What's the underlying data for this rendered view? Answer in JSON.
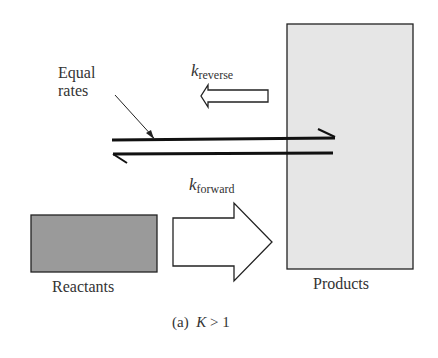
{
  "labels": {
    "equal_rates_line1": "Equal",
    "equal_rates_line2": "rates",
    "k_reverse_symbol": "k",
    "k_reverse_subscript": "reverse",
    "k_forward_symbol": "k",
    "k_forward_subscript": "forward",
    "reactants": "Reactants",
    "products": "Products",
    "caption_prefix": "(a)",
    "caption_var": "K",
    "caption_rel": "> 1"
  },
  "colors": {
    "reactants_fill": "#9a9a9a",
    "products_fill": "#e6e6e6",
    "stroke": "#222222"
  }
}
